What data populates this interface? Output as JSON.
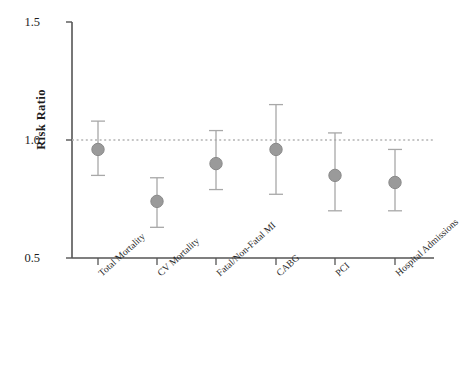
{
  "chart_data": {
    "type": "scatter",
    "plot_style": "forest-plot-with-error-bars",
    "title": "",
    "xlabel": "",
    "ylabel": "Risk Ratio",
    "ylim": [
      0.5,
      1.5
    ],
    "yticks": [
      "0.5",
      "1.0",
      "1.5"
    ],
    "ytick_values": [
      0.5,
      1.0,
      1.5
    ],
    "grid": false,
    "legend": "none",
    "reference_line": {
      "value": 1.0,
      "style": "dotted",
      "color": "#b4b4b4",
      "label": ""
    },
    "categories": [
      "Total Mortality",
      "CV Mortality",
      "Fatal/Non-Fatal MI",
      "CABG",
      "PCI",
      "Hospital Admissions"
    ],
    "values": [
      0.96,
      0.74,
      0.9,
      0.96,
      0.85,
      0.82
    ],
    "ci_low": [
      0.85,
      0.63,
      0.79,
      0.77,
      0.7,
      0.7
    ],
    "ci_high": [
      1.08,
      0.84,
      1.04,
      1.15,
      1.03,
      0.96
    ],
    "marker_color": "#9a9a9a",
    "marker_edge_color": "#8a8a8a",
    "errorbar_color": "#a8a8a8",
    "axis_color": "#555555",
    "points": [
      {
        "category": "Total Mortality",
        "value": 0.96,
        "ci_low": 0.85,
        "ci_high": 1.08
      },
      {
        "category": "CV Mortality",
        "value": 0.74,
        "ci_low": 0.63,
        "ci_high": 0.84
      },
      {
        "category": "Fatal/Non-Fatal MI",
        "value": 0.9,
        "ci_low": 0.79,
        "ci_high": 1.04
      },
      {
        "category": "CABG",
        "value": 0.96,
        "ci_low": 0.77,
        "ci_high": 1.15
      },
      {
        "category": "PCI",
        "value": 0.85,
        "ci_low": 0.7,
        "ci_high": 1.03
      },
      {
        "category": "Hospital Admissions",
        "value": 0.82,
        "ci_low": 0.7,
        "ci_high": 0.96
      }
    ]
  }
}
